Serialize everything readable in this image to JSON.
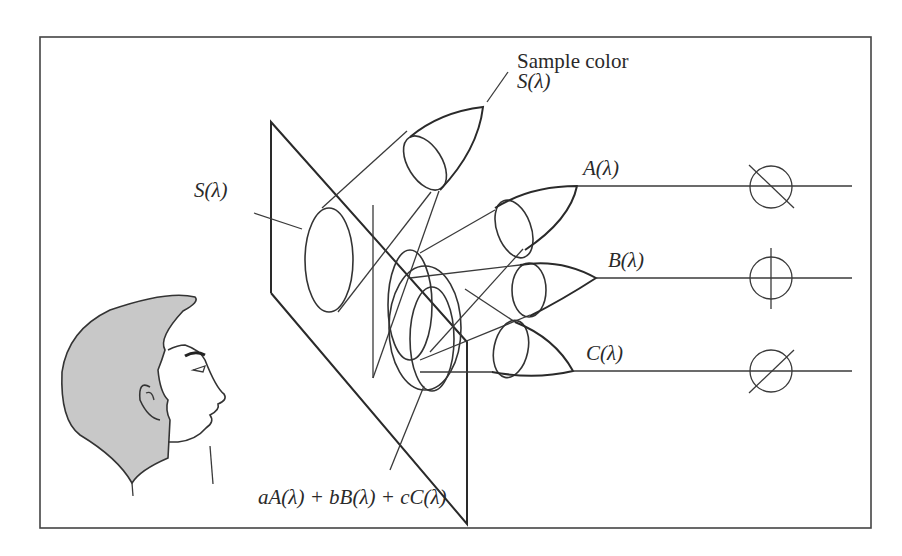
{
  "figure": {
    "frame": {
      "x": 40,
      "y": 37,
      "width": 831,
      "height": 491,
      "color": "#333333"
    }
  },
  "labels": {
    "sample_color_line1": "Sample color",
    "sample_color_line2": "S(λ)",
    "screen_sample": "S(λ)",
    "primary_a": "A(λ)",
    "primary_b": "B(λ)",
    "primary_c": "C(λ)",
    "mixture": "aA(λ) + bB(λ) + cC(λ)"
  },
  "primaries": [
    {
      "name": "A(λ)",
      "meter_icon": "dial-diagonal-down",
      "y": 186
    },
    {
      "name": "B(λ)",
      "meter_icon": "dial-vertical",
      "y": 278
    },
    {
      "name": "C(λ)",
      "meter_icon": "dial-diagonal-up",
      "y": 371
    }
  ],
  "colors": {
    "line": "#333333",
    "hair_fill": "#c8c8c8",
    "background": "#ffffff"
  }
}
